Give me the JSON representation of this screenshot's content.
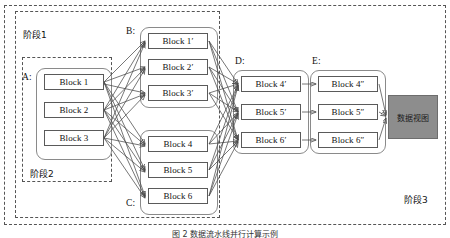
{
  "figure": {
    "caption": "图 2  数据流水线并行计算示例",
    "sink": {
      "label": "数据视图",
      "color": "#8d8d8d"
    }
  },
  "stages": [
    {
      "id": "stage1",
      "label": "阶段1"
    },
    {
      "id": "stage2",
      "label": "阶段2"
    },
    {
      "id": "stage3",
      "label": "阶段3"
    }
  ],
  "groups": [
    {
      "id": "A",
      "caption": "A:",
      "blocks": [
        {
          "label": "Block 1"
        },
        {
          "label": "Block 2"
        },
        {
          "label": "Block 3"
        }
      ]
    },
    {
      "id": "B",
      "caption": "B:",
      "blocks": [
        {
          "label": "Block 1′"
        },
        {
          "label": "Block 2′"
        },
        {
          "label": "Block 3′"
        }
      ]
    },
    {
      "id": "C",
      "caption": "C:",
      "blocks": [
        {
          "label": "Block 4"
        },
        {
          "label": "Block 5"
        },
        {
          "label": "Block 6"
        }
      ]
    },
    {
      "id": "D",
      "caption": "D:",
      "blocks": [
        {
          "label": "Block 4′"
        },
        {
          "label": "Block 5′"
        },
        {
          "label": "Block 6′"
        }
      ]
    },
    {
      "id": "E",
      "caption": "E:",
      "blocks": [
        {
          "label": "Block 4″"
        },
        {
          "label": "Block 5″"
        },
        {
          "label": "Block 6″"
        }
      ]
    }
  ],
  "edges": {
    "a_to_b": "all-to-all",
    "a_to_c": "all-to-all",
    "b_to_d": "all-to-all",
    "c_to_d": "all-to-all",
    "d_to_e": "one-to-one",
    "e_to_sink": "all-to-one"
  },
  "colors": {
    "edge": "#4a4a4a",
    "block_border": "#5a5a5a",
    "group_border": "#8a8a8a",
    "frame_dashed": "#555555",
    "sink_fill": "#8d8d8d",
    "background": "#ffffff"
  }
}
